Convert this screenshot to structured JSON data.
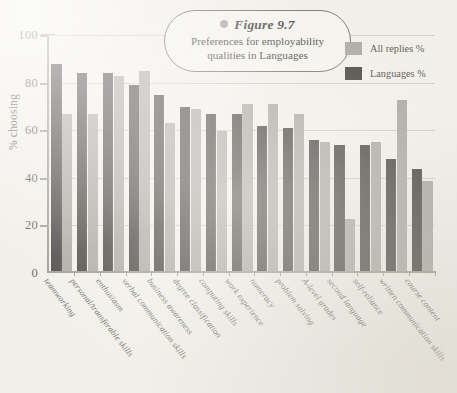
{
  "figure": {
    "label": "Figure 9.7",
    "caption": "Preferences for employability qualities in Languages",
    "bullet_icon": "bullet-dot-icon"
  },
  "legend": {
    "position": "top-right",
    "entries": [
      {
        "label": "All replies %",
        "color": "#9d9a95",
        "swatch_icon": "legend-swatch-gray"
      },
      {
        "label": "Languages %",
        "color": "#231f20",
        "swatch_icon": "legend-swatch-dark"
      }
    ]
  },
  "axes": {
    "ylabel": "% choosing",
    "yticks": [
      "0",
      "20",
      "40",
      "60",
      "80",
      "100"
    ],
    "ylim": [
      0,
      100
    ],
    "grid": true
  },
  "chart_data": {
    "type": "bar",
    "title": "Preferences for employability qualities in Languages",
    "xlabel": "",
    "ylabel": "% choosing",
    "ylim": [
      0,
      100
    ],
    "yticks": [
      0,
      20,
      40,
      60,
      80,
      100
    ],
    "grid": true,
    "legend_position": "top-right",
    "categories": [
      "teamworking",
      "personal/transferable skills",
      "enthusiasm",
      "verbal communication skills",
      "business awareness",
      "degree classification",
      "computing skills",
      "work experience",
      "numeracy",
      "problem solving",
      "A-level grades",
      "second language",
      "self-reliance",
      "written communication skills",
      "course content"
    ],
    "series": [
      {
        "name": "Languages %",
        "color": "#231f20",
        "values": [
          87,
          83,
          83,
          78,
          74,
          69,
          66,
          66,
          61,
          60,
          55,
          53,
          53,
          47,
          43
        ]
      },
      {
        "name": "All replies %",
        "color": "#9d9a95",
        "values": [
          66,
          66,
          82,
          84,
          62,
          68,
          59,
          70,
          70,
          66,
          54,
          22,
          54,
          72,
          38
        ]
      }
    ]
  }
}
